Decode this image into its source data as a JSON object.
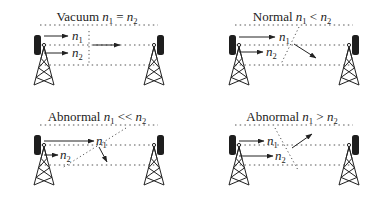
{
  "panels": [
    {
      "id": "vacuum",
      "title_prefix": "Vacuum ",
      "relation": "=",
      "caption": "Vacuum n1 = n2",
      "refraction": "straight",
      "labels": {
        "n1": "n",
        "n1_sub": "1",
        "n2": "n",
        "n2_sub": "2"
      }
    },
    {
      "id": "normal",
      "title_prefix": "Normal ",
      "relation": "<",
      "caption": "Normal n1 < n2",
      "refraction": "bends-down",
      "labels": {
        "n1": "n",
        "n1_sub": "1",
        "n2": "n",
        "n2_sub": "2"
      }
    },
    {
      "id": "abnormal-much-less",
      "title_prefix": "Abnormal ",
      "relation": "<<",
      "caption": "Abnormal n1 << n2",
      "refraction": "bends-steeply-down",
      "labels": {
        "n1": "n",
        "n1_sub": "1",
        "n2": "n",
        "n2_sub": "2"
      }
    },
    {
      "id": "abnormal-greater",
      "title_prefix": "Abnormal ",
      "relation": ">",
      "caption": "Abnormal n1 > n2",
      "refraction": "bends-up",
      "labels": {
        "n1": "n",
        "n1_sub": "1",
        "n2": "n",
        "n2_sub": "2"
      }
    }
  ],
  "icons": {
    "transmitter": "radio-tower-icon",
    "receiver": "radio-tower-icon"
  },
  "colors": {
    "ink": "#222222",
    "dotted": "#555555",
    "background": "#ffffff"
  }
}
